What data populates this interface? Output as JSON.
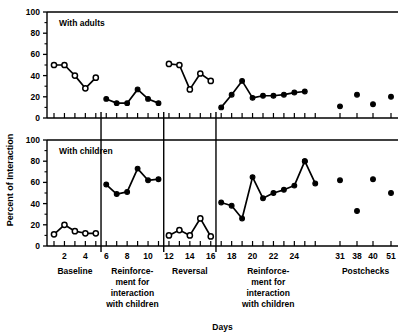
{
  "chart_data": {
    "type": "line",
    "title": "",
    "xlabel": "Days",
    "ylabel": "Percent of Interaction",
    "ylim": [
      0,
      100
    ],
    "yticks": [
      0,
      20,
      40,
      60,
      80,
      100
    ],
    "xlim": [
      0.5,
      52
    ],
    "grid": false,
    "legend": "none",
    "panels": [
      {
        "name": "upper",
        "label": "With adults",
        "marker": "open-circle",
        "segments": [
          {
            "phase": "Baseline",
            "x": [
              1,
              2,
              3,
              4,
              5
            ],
            "y": [
              50,
              50,
              40,
              28,
              38
            ]
          },
          {
            "phase": "Reinforcement for interaction with children",
            "x": [
              6,
              7,
              8,
              9,
              10,
              11
            ],
            "y": [
              18,
              14,
              14,
              27,
              18,
              14
            ]
          },
          {
            "phase": "Reversal",
            "x": [
              12,
              13,
              14,
              15,
              16
            ],
            "y": [
              51,
              50,
              27,
              42,
              35
            ]
          },
          {
            "phase": "Reinforcement for interaction with children",
            "x": [
              17,
              18,
              19,
              20,
              21,
              22,
              23,
              24,
              25
            ],
            "y": [
              10,
              22,
              35,
              19,
              21,
              21,
              22,
              24,
              25
            ]
          },
          {
            "phase": "Postchecks",
            "x": [
              31,
              38,
              40,
              51
            ],
            "y": [
              11,
              22,
              13,
              20
            ],
            "points_only": true
          }
        ]
      },
      {
        "name": "lower",
        "label": "With children",
        "marker": "open-circle",
        "segments": [
          {
            "phase": "Baseline",
            "x": [
              1,
              2,
              3,
              4,
              5
            ],
            "y": [
              11,
              20,
              14,
              12,
              12
            ]
          },
          {
            "phase": "Reinforcement for interaction with children",
            "x": [
              6,
              7,
              8,
              9,
              10,
              11
            ],
            "y": [
              58,
              49,
              51,
              73,
              62,
              63
            ]
          },
          {
            "phase": "Reversal",
            "x": [
              12,
              13,
              14,
              15,
              16
            ],
            "y": [
              10,
              15,
              10,
              26,
              9
            ]
          },
          {
            "phase": "Reinforcement for interaction with children",
            "x": [
              17,
              18,
              19,
              20,
              21,
              22,
              23,
              24,
              25
            ],
            "y": [
              41,
              38,
              26,
              65,
              45,
              50,
              53,
              57,
              80
            ]
          },
          {
            "phase": "Reinforcement tail",
            "x": [
              25,
              26
            ],
            "y": [
              80,
              59
            ]
          },
          {
            "phase": "Postchecks",
            "x": [
              31,
              38,
              40,
              51
            ],
            "y": [
              62,
              33,
              63,
              50
            ],
            "points_only": true
          }
        ]
      }
    ],
    "phase_labels": [
      {
        "id": "baseline",
        "lines": [
          "Baseline"
        ]
      },
      {
        "id": "reinforcement-1",
        "lines": [
          "Reinforce-",
          "ment for",
          "interaction",
          "with children"
        ]
      },
      {
        "id": "reversal",
        "lines": [
          "Reversal"
        ]
      },
      {
        "id": "reinforcement-2",
        "lines": [
          "Reinforce-",
          "ment for",
          "interaction",
          "with children"
        ]
      },
      {
        "id": "postchecks",
        "lines": [
          "Postchecks"
        ]
      }
    ],
    "xtick_labels": [
      "2",
      "4",
      "6",
      "8",
      "10",
      "12",
      "14",
      "16",
      "18",
      "20",
      "22",
      "24",
      "31",
      "38",
      "40",
      "51"
    ],
    "colors": {
      "line": "#000000",
      "marker_fill_open": "#ffffff",
      "marker_fill_closed": "#000000",
      "axis": "#000000"
    }
  },
  "figure": {
    "y_axis_title": "Percent of Interaction",
    "x_axis_title": "Days",
    "upper_panel_label": "With adults",
    "lower_panel_label": "With children",
    "y_tick_0": "0",
    "y_tick_20": "20",
    "y_tick_40": "40",
    "y_tick_60": "60",
    "y_tick_80": "80",
    "y_tick_100": "100"
  }
}
